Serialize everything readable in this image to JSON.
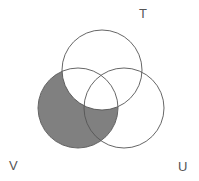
{
  "figure": {
    "kind": "venn-diagram",
    "title": "",
    "background_color": "#ffffff",
    "width": 199,
    "height": 181,
    "shaded_region_description": "V minus T",
    "shade_color": "#808080",
    "stroke_color": "#555555",
    "stroke_width": 0.9,
    "label_color": "#555555"
  },
  "sets": [
    {
      "id": "T",
      "label": "T",
      "cx": 102,
      "cy": 70,
      "r": 40,
      "filled": false,
      "fill_color": "#ffffff"
    },
    {
      "id": "V",
      "label": "V",
      "cx": 78,
      "cy": 108,
      "r": 40,
      "filled": true,
      "fill_color": "#808080"
    },
    {
      "id": "U",
      "label": "U",
      "cx": 124,
      "cy": 108,
      "r": 40,
      "filled": false,
      "fill_color": "#ffffff"
    }
  ],
  "labels": {
    "T": "T",
    "V": "V",
    "U": "U"
  },
  "chart_data": {
    "type": "diagram",
    "subtype": "venn3",
    "title": "",
    "categories": [
      "T",
      "V",
      "U"
    ],
    "regions": [
      {
        "name": "T only",
        "in": [
          "T"
        ],
        "shaded": false
      },
      {
        "name": "V only",
        "in": [
          "V"
        ],
        "shaded": true
      },
      {
        "name": "U only",
        "in": [
          "U"
        ],
        "shaded": false
      },
      {
        "name": "T and V",
        "in": [
          "T",
          "V"
        ],
        "shaded": false
      },
      {
        "name": "T and U",
        "in": [
          "T",
          "U"
        ],
        "shaded": false
      },
      {
        "name": "V and U",
        "in": [
          "V",
          "U"
        ],
        "shaded": true
      },
      {
        "name": "T and V and U",
        "in": [
          "T",
          "V",
          "U"
        ],
        "shaded": false
      }
    ],
    "shaded_expression": "V \\ T",
    "legend": [],
    "xlabel": "",
    "ylabel": ""
  }
}
